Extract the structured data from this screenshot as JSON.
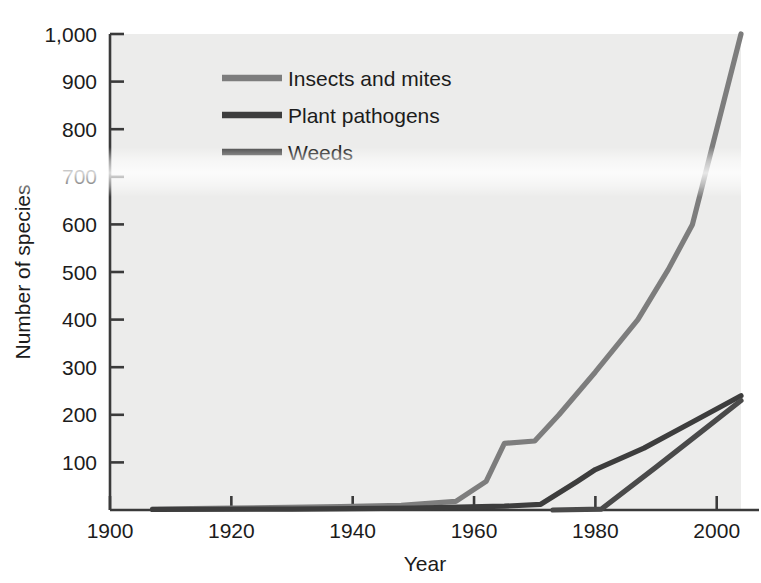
{
  "chart_data": {
    "type": "line",
    "title": "",
    "xlabel": "Year",
    "ylabel": "Number of species",
    "xlim": [
      1900,
      2004
    ],
    "ylim": [
      0,
      1000
    ],
    "grid": false,
    "legend_position": "top-left-inside",
    "xticks": [
      1900,
      1920,
      1940,
      1960,
      1980,
      2000
    ],
    "xtick_labels": [
      "1900",
      "1920",
      "1940",
      "1960",
      "1980",
      "2000"
    ],
    "yticks": [
      100,
      200,
      300,
      400,
      500,
      600,
      700,
      800,
      900,
      1000
    ],
    "ytick_labels": [
      "100",
      "200",
      "300",
      "400",
      "500",
      "600",
      "700",
      "800",
      "900",
      "1,000"
    ],
    "series": [
      {
        "name": "Insects and mites",
        "color": "#7d7d7d",
        "x": [
          1907,
          1920,
          1938,
          1948,
          1957,
          1962,
          1965,
          1970,
          1974,
          1980,
          1987,
          1992,
          1996,
          2004
        ],
        "y": [
          2,
          4,
          7,
          10,
          18,
          60,
          140,
          145,
          200,
          290,
          400,
          505,
          600,
          1000
        ]
      },
      {
        "name": "Plant pathogens",
        "color": "#3d3d3d",
        "x": [
          1907,
          1930,
          1950,
          1965,
          1971,
          1977,
          1980,
          1988,
          1996,
          2004
        ],
        "y": [
          1,
          2,
          4,
          8,
          12,
          60,
          85,
          130,
          185,
          240
        ]
      },
      {
        "name": "Weeds",
        "color": "#4a4a4a",
        "x": [
          1973,
          1981,
          1990,
          1998,
          2004
        ],
        "y": [
          0,
          2,
          90,
          170,
          230
        ]
      }
    ]
  },
  "legend": {
    "entries": [
      {
        "label": "Insects and mites",
        "color": "#7d7d7d"
      },
      {
        "label": "Plant pathogens",
        "color": "#3d3d3d"
      },
      {
        "label": "Weeds",
        "color": "#4a4a4a"
      }
    ]
  },
  "axes": {
    "x_title": "Year",
    "y_title": "Number of species",
    "x_tick_labels": [
      "1900",
      "1920",
      "1940",
      "1960",
      "1980",
      "2000"
    ],
    "y_tick_labels": [
      "1,000",
      "900",
      "800",
      "700",
      "600",
      "500",
      "400",
      "300",
      "200",
      "100"
    ]
  },
  "colors": {
    "plot_background": "#ececeb",
    "axis_line": "#3a3a3a",
    "text": "#1c1c1c"
  }
}
